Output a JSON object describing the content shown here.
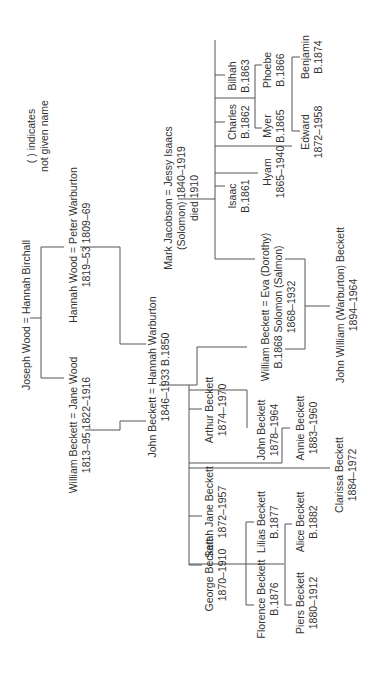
{
  "diagram": {
    "type": "family-tree",
    "orientation": "rotated-90-ccw",
    "legend": {
      "line1": "( ) indicates",
      "line2": "not given name"
    },
    "people": {
      "joseph_hannah": {
        "line1": "Joseph Wood = Hannah Birchall"
      },
      "hannah_peter": {
        "line1": "Hannah Wood = Peter Warburton",
        "line2": "1819–53          1809–69"
      },
      "william_jane": {
        "line1": "William Beckett = Jane Wood",
        "line2": "1813–95          1822–1916"
      },
      "john_hannah": {
        "line1": "John Beckett = Hannah Warburton",
        "line2": "1846–1933          B.1850"
      },
      "mark_jessy": {
        "line1": "Mark Jacobson = Jessy Isaacs",
        "line2": "(Solomon)          1840–1919",
        "line3": "died 1910"
      },
      "isaac": {
        "name": "Isaac",
        "dates": "B.1861"
      },
      "charles": {
        "name": "Charles",
        "dates": "B.1862"
      },
      "bilhah": {
        "name": "Bilhah",
        "dates": "B.1863"
      },
      "hyam": {
        "name": "Hyam",
        "dates": "1865–1940"
      },
      "myer": {
        "name": "Myer",
        "dates": "B.1865"
      },
      "phoebe": {
        "name": "Phoebe",
        "dates": "B.1866"
      },
      "edward": {
        "name": "Edward",
        "dates": "1872–1958"
      },
      "benjamin": {
        "name": "Benjamin",
        "dates": "B.1874"
      },
      "william_eva": {
        "line1": "William Beckett  =  Eva (Dorothy)",
        "line2": "B.1868        Solomon (Salmon)",
        "line3": "1868–1932"
      },
      "john_william": {
        "name": "John William (Warburton) Beckett",
        "dates": "1894–1964"
      },
      "george": {
        "name": "George Beckett",
        "dates": "1870–1910"
      },
      "sarah_jane": {
        "name": "Sarah Jane Beckett",
        "dates": "1872–1957"
      },
      "arthur": {
        "name": "Arthur Beckett",
        "dates": "1874–1970"
      },
      "florence": {
        "name": "Florence Beckett",
        "dates": "B.1876"
      },
      "lilias": {
        "name": "Lilias Beckett",
        "dates": "B.1877"
      },
      "john_b": {
        "name": "John Beckett",
        "dates": "1878–1964"
      },
      "piers": {
        "name": "Piers Beckett",
        "dates": "1880–1912"
      },
      "alice": {
        "name": "Alice Beckett",
        "dates": "B.1882"
      },
      "annie": {
        "name": "Annie Beckett",
        "dates": "1883–1960"
      },
      "clarissa": {
        "name": "Clarissa Beckett",
        "dates": "1884–1972"
      }
    }
  }
}
